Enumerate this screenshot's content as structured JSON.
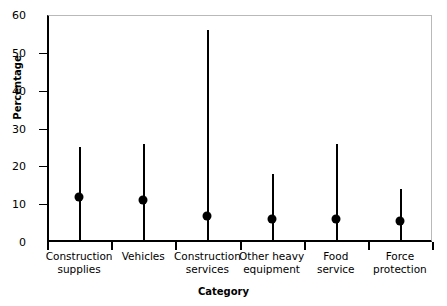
{
  "chart_data": {
    "type": "scatter",
    "title": "",
    "xlabel": "Category",
    "ylabel": "Percentage",
    "ylim": [
      0,
      60
    ],
    "yticks": [
      0,
      10,
      20,
      30,
      40,
      50,
      60
    ],
    "ytick_labels": [
      "0",
      "10",
      "20",
      "30",
      "40",
      "50",
      "60"
    ],
    "grid": false,
    "legend": null,
    "categories": [
      "Construction\nsupplies",
      "Vehicles",
      "Construction\nservices",
      "Other heavy\nequipment",
      "Food\nservice",
      "Force\nprotection"
    ],
    "values": [
      12,
      11,
      7,
      6,
      6,
      5.5
    ],
    "error_low": [
      0,
      0,
      0,
      0,
      0,
      0
    ],
    "error_high": [
      25,
      26,
      56,
      18,
      26,
      14
    ],
    "series": [
      {
        "name": "Percentage",
        "values": [
          12,
          11,
          7,
          6,
          6,
          5.5
        ]
      }
    ],
    "marker_color": "#000000",
    "line_color": "#000000",
    "axis_color": "#000000",
    "background_color": "#ffffff"
  }
}
